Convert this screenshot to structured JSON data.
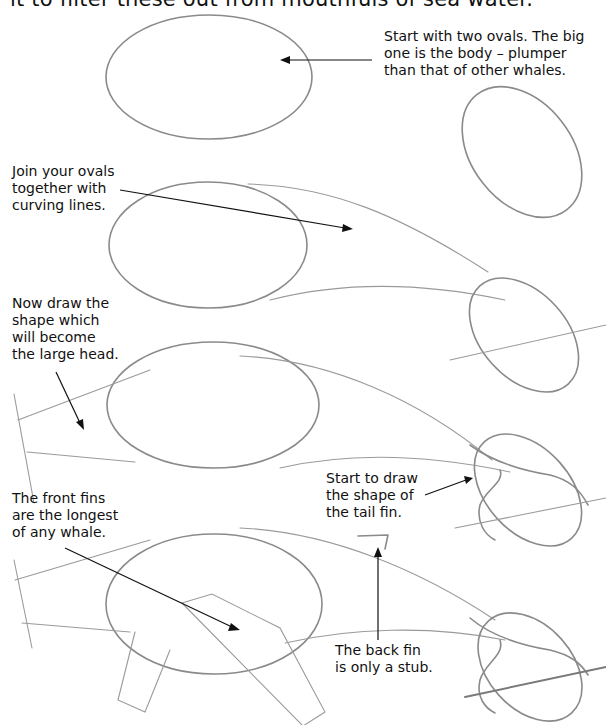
{
  "page": {
    "intro_text": "it to filter these out from mouthfuls of sea water."
  },
  "steps": [
    {
      "id": 1,
      "caption": "Start with two ovals. The big\none is the body – plumper\nthan that of other whales."
    },
    {
      "id": 2,
      "caption": "Join your ovals\ntogether with\ncurving lines."
    },
    {
      "id": 3,
      "caption": "Now draw the\nshape which\nwill become\nthe large head."
    },
    {
      "id": 4,
      "caption": "Start to draw\nthe shape of\nthe tail fin."
    },
    {
      "id": 5,
      "caption": "The front fins\nare the longest\nof any whale."
    },
    {
      "id": 6,
      "caption": "The back fin\nis only a stub."
    }
  ],
  "colors": {
    "pencil": "#8a8a8a",
    "ink": "#111111",
    "background": "#ffffff"
  }
}
